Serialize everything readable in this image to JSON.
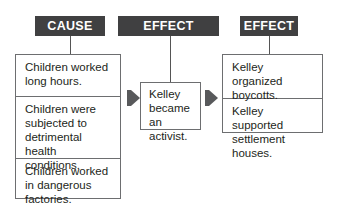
{
  "headers": {
    "cause": "CAUSE",
    "effect_cause": "EFFECT (CAUSE)",
    "effect": "EFFECT"
  },
  "causes": [
    "Children worked long hours.",
    "Children were subjected to detrimental health conditions.",
    "Children worked in dangerous factories."
  ],
  "middle": "Kelley became an activist.",
  "effects": [
    "Kelley organized boycotts.",
    "Kelley supported settlement houses."
  ],
  "colors": {
    "header_bg": "#404041",
    "header_text": "#ffffff",
    "arrow": "#58595b",
    "border": "#6d6e70"
  }
}
